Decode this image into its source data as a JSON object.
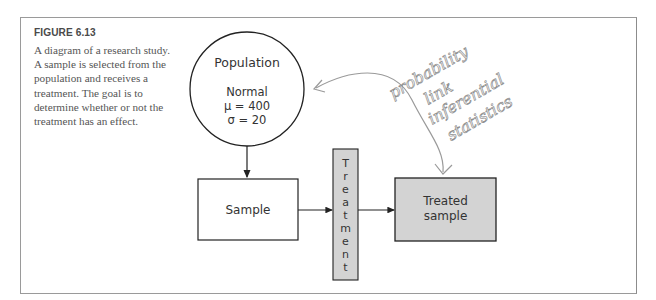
{
  "figure": {
    "label": "FIGURE 6.13",
    "caption": "A diagram of a research study. A sample is selected from the population and receives a treatment. The goal is to determine whether or not the treatment has an effect."
  },
  "diagram": {
    "population": {
      "title": "Population",
      "distribution": "Normal",
      "mean": "μ = 400",
      "sd": "σ = 20"
    },
    "sample": {
      "label": "Sample"
    },
    "treatment": {
      "letters": [
        "T",
        "r",
        "e",
        "a",
        "t",
        "m",
        "e",
        "n",
        "t"
      ],
      "label": "Treatment",
      "fill": "#d3d3d3"
    },
    "treated_sample": {
      "line1": "Treated",
      "line2": "sample",
      "fill": "#d3d3d3"
    },
    "annotation": {
      "lines": [
        "probability",
        "link",
        "inferential",
        "statistics"
      ],
      "color": "#9a9a9a"
    }
  }
}
